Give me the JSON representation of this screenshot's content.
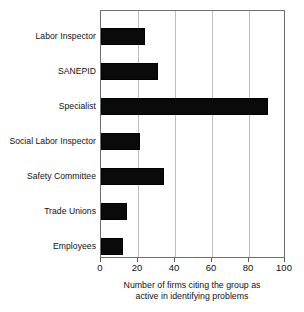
{
  "chart_data": {
    "type": "bar",
    "orientation": "horizontal",
    "title": "",
    "xlabel_line1": "Number of firms citing the group as",
    "xlabel_line2": "active in identifying problems",
    "ylabel": "",
    "categories": [
      "Labor Inspector",
      "SANEPID",
      "Specialist",
      "Social Labor Inspector",
      "Safety Committee",
      "Trade Unions",
      "Employees"
    ],
    "values": [
      24,
      31,
      91,
      21,
      34,
      14,
      12
    ],
    "xlim": [
      0,
      100
    ],
    "xticks": [
      0,
      20,
      40,
      60,
      80,
      100
    ],
    "xtick_labels": [
      "0",
      "20",
      "40",
      "60",
      "80",
      "100"
    ],
    "grid": "vertical",
    "legend": "none",
    "bar_color": "#0a0a0a",
    "grid_color": "#bdbdbd",
    "frame_color": "#6f6f6f",
    "background": "#ffffff"
  }
}
